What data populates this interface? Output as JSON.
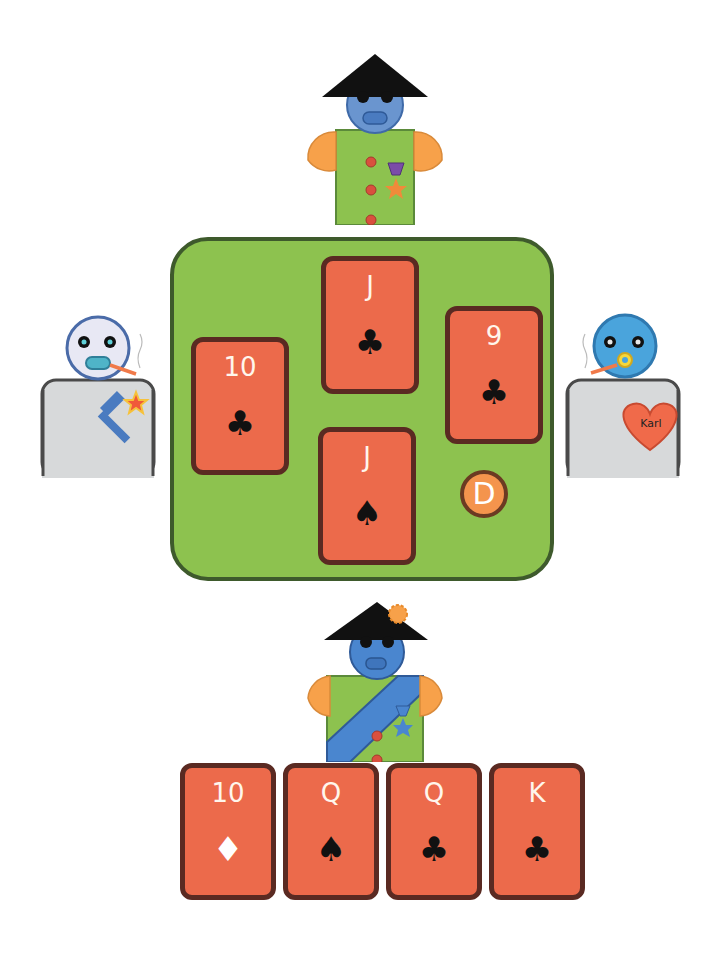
{
  "game": {
    "type": "trick-taking card game",
    "colors": {
      "table_felt": "#8dc24f",
      "table_border": "#3e5a2c",
      "card_face": "#ec6a4b",
      "card_border": "#5a2a22",
      "dealer_chip": "#f4944d"
    }
  },
  "players": {
    "top": {
      "avatar": "soldier-green-uniform-conical-hat",
      "badges": [
        "purple-medal-icon",
        "orange-star-icon"
      ]
    },
    "left": {
      "avatar": "pale-robot-grey-body",
      "badges": [
        "hammer-star-icon"
      ]
    },
    "right": {
      "avatar": "blue-robot-grey-body",
      "badges": [
        "heart-badge-icon"
      ],
      "heart_label": "Karl"
    },
    "bottom": {
      "avatar": "soldier-green-uniform-sash-conical-hat",
      "badges": [
        "blue-medal-icon"
      ]
    }
  },
  "table": {
    "played_cards": [
      {
        "position": "left",
        "rank": "10",
        "suit": "♣",
        "suit_name": "clubs"
      },
      {
        "position": "top",
        "rank": "J",
        "suit": "♣",
        "suit_name": "clubs"
      },
      {
        "position": "right",
        "rank": "9",
        "suit": "♣",
        "suit_name": "clubs"
      },
      {
        "position": "bottom",
        "rank": "J",
        "suit": "♠",
        "suit_name": "spades"
      }
    ],
    "dealer_chip": "D"
  },
  "hand": {
    "cards": [
      {
        "rank": "10",
        "suit": "♦",
        "suit_name": "diamonds"
      },
      {
        "rank": "Q",
        "suit": "♠",
        "suit_name": "spades"
      },
      {
        "rank": "Q",
        "suit": "♣",
        "suit_name": "clubs"
      },
      {
        "rank": "K",
        "suit": "♣",
        "suit_name": "clubs"
      }
    ]
  }
}
